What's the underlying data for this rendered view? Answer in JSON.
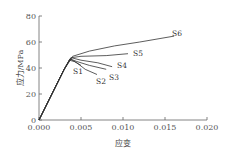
{
  "chart_data": {
    "type": "line",
    "title": "",
    "xlabel": "应变",
    "ylabel": "应力/MPa",
    "xlim": [
      0.0,
      0.02
    ],
    "ylim": [
      0,
      80
    ],
    "xticks": [
      "0.000",
      "0.005",
      "0.010",
      "0.015",
      "0.020"
    ],
    "yticks": [
      "0",
      "20",
      "40",
      "60",
      "80"
    ],
    "grid": false,
    "legend_position": "inline labels",
    "series": [
      {
        "name": "S1",
        "x": [
          0,
          0.001,
          0.002,
          0.003,
          0.0036,
          0.0042,
          0.005
        ],
        "y": [
          0,
          13,
          26,
          39,
          46,
          45,
          42
        ]
      },
      {
        "name": "S2",
        "x": [
          0,
          0.001,
          0.002,
          0.003,
          0.0037,
          0.0045,
          0.0055,
          0.0069
        ],
        "y": [
          0,
          13,
          26,
          39,
          47,
          44,
          39,
          35
        ]
      },
      {
        "name": "S3",
        "x": [
          0,
          0.001,
          0.002,
          0.003,
          0.0037,
          0.0045,
          0.006,
          0.008
        ],
        "y": [
          0,
          13,
          26,
          39,
          47,
          45,
          42,
          39
        ]
      },
      {
        "name": "S4",
        "x": [
          0,
          0.001,
          0.002,
          0.003,
          0.0038,
          0.005,
          0.007,
          0.0087
        ],
        "y": [
          0,
          13,
          26,
          39,
          48,
          46,
          44,
          41
        ]
      },
      {
        "name": "S5",
        "x": [
          0,
          0.001,
          0.002,
          0.003,
          0.0039,
          0.005,
          0.008,
          0.0106
        ],
        "y": [
          0,
          13,
          26,
          39,
          48,
          49,
          49.5,
          51
        ]
      },
      {
        "name": "S6",
        "x": [
          0,
          0.001,
          0.002,
          0.003,
          0.004,
          0.006,
          0.009,
          0.012,
          0.0161
        ],
        "y": [
          0,
          13,
          26,
          39,
          49,
          53,
          57,
          60,
          64.5
        ]
      }
    ]
  }
}
